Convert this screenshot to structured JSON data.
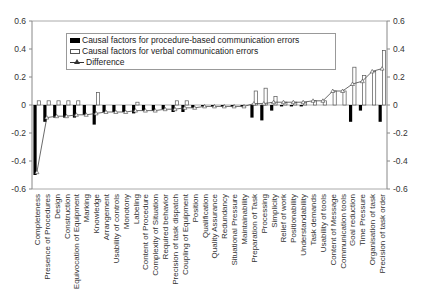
{
  "chart_data": {
    "type": "bar",
    "title": "",
    "xlabel": "",
    "ylabel": "",
    "ylim": [
      -0.6,
      0.6
    ],
    "yticks": [
      0.6,
      0.4,
      0.2,
      0,
      -0.2,
      -0.4,
      -0.6
    ],
    "ytick_labels": [
      "0.6",
      "0.4",
      "0.2",
      "0",
      "-0.2",
      "-0.4",
      "-0.6"
    ],
    "secondary_y_axis": true,
    "grid": false,
    "legend_position": "upper-left-inside",
    "categories": [
      "Completeness",
      "Presence of Procedures",
      "Design",
      "Construction",
      "Equivocation of Equipment",
      "Marking",
      "Knowledge",
      "Arrangement",
      "Usability of controls",
      "Monotony",
      "Labeling",
      "Content of Procedure",
      "Complexity of Situation",
      "Required behavior",
      "Precision of task dispatch",
      "Coupling of Equipment",
      "Position",
      "Qualification",
      "Quality Assurance",
      "Redundancy",
      "Situational Pressure",
      "Maintainability",
      "Preparation of Task",
      "Processing",
      "Simplicity",
      "Relief of work",
      "Positionability",
      "Understandability",
      "Task demands",
      "Usability of tools",
      "Content of Message",
      "Communication tools",
      "Goal reduction",
      "Time Pressure",
      "Organisation of task",
      "Precision of task order"
    ],
    "series": [
      {
        "name": "Causal factors for procedure-based communication errors",
        "type": "bar",
        "color": "#000000",
        "values": [
          -0.5,
          -0.12,
          -0.09,
          -0.09,
          -0.09,
          -0.07,
          -0.14,
          -0.05,
          -0.05,
          -0.05,
          -0.06,
          -0.04,
          -0.04,
          -0.03,
          -0.05,
          -0.05,
          -0.02,
          -0.01,
          -0.01,
          -0.01,
          -0.01,
          -0.01,
          -0.09,
          -0.11,
          -0.04,
          -0.01,
          -0.01,
          -0.01,
          0,
          0,
          0,
          0,
          -0.12,
          -0.04,
          0,
          -0.12
        ]
      },
      {
        "name": "Causal factors for verbal communication errors",
        "type": "bar",
        "color": "#ffffff",
        "values": [
          0.03,
          0.03,
          0.03,
          0.03,
          0.03,
          0,
          0.09,
          0,
          0,
          0,
          0.02,
          0,
          0,
          0,
          0.03,
          0.03,
          0,
          0,
          0,
          0,
          0,
          0,
          0.1,
          0.12,
          0.06,
          0.02,
          0.02,
          0.02,
          0.03,
          0.03,
          0.1,
          0.1,
          0.27,
          0.21,
          0.24,
          0.39
        ]
      },
      {
        "name": "Difference",
        "type": "line",
        "marker": "triangle",
        "color": "#333333",
        "values": [
          -0.48,
          -0.09,
          -0.08,
          -0.08,
          -0.07,
          -0.07,
          -0.06,
          -0.05,
          -0.05,
          -0.05,
          -0.04,
          -0.04,
          -0.04,
          -0.03,
          -0.03,
          -0.02,
          -0.02,
          -0.01,
          -0.01,
          -0.01,
          -0.01,
          -0.01,
          0.01,
          0.01,
          0.02,
          0.02,
          0.02,
          0.02,
          0.03,
          0.03,
          0.1,
          0.1,
          0.15,
          0.17,
          0.24,
          0.26
        ]
      }
    ]
  },
  "legend": {
    "items": [
      {
        "label": "Causal factors for procedure-based communication errors",
        "swatch": "black-bar"
      },
      {
        "label": "Causal factors for verbal communication errors",
        "swatch": "white-bar"
      },
      {
        "label": "Difference",
        "swatch": "line-triangle"
      }
    ]
  }
}
